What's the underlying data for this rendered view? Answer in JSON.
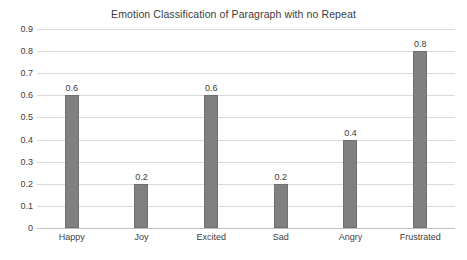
{
  "chart_data": {
    "type": "bar",
    "title": "Emotion Classification of Paragraph with no Repeat",
    "xlabel": "",
    "ylabel": "",
    "categories": [
      "Happy",
      "Joy",
      "Excited",
      "Sad",
      "Angry",
      "Frustrated"
    ],
    "values": [
      0.6,
      0.2,
      0.6,
      0.2,
      0.4,
      0.8
    ],
    "value_labels": [
      "0.6",
      "0.2",
      "0.6",
      "0.2",
      "0.4",
      "0.8"
    ],
    "ylim": [
      0,
      0.9
    ],
    "ytick_labels": [
      "0.9",
      "0.8",
      "0.7",
      "0.6",
      "0.5",
      "0.4",
      "0.3",
      "0.2",
      "0.1",
      "0"
    ],
    "ytick_values": [
      0.9,
      0.8,
      0.7,
      0.6,
      0.5,
      0.4,
      0.3,
      0.2,
      0.1,
      0
    ],
    "grid": true,
    "legend": false,
    "legend_position": "none",
    "series_color": "#808080",
    "gridline_color": "#d9d9d9",
    "text_color": "#404040",
    "background_color": "#ffffff",
    "data_labels_shown": true
  }
}
